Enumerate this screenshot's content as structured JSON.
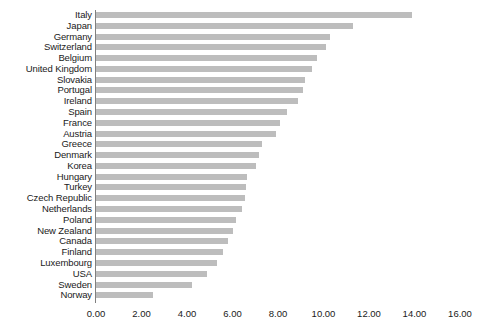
{
  "chart_data": {
    "type": "bar",
    "orientation": "horizontal",
    "title": "",
    "subtitle": "",
    "xlabel": "",
    "ylabel": "",
    "xlim": [
      0,
      16
    ],
    "ylim": null,
    "grid": false,
    "legend": null,
    "legend_position": "none",
    "bar_color": "#bdbdbd",
    "axis_color": "#808080",
    "background_color": "#ffffff",
    "text_color": "#1a1a1a",
    "xticks": [
      "0.00",
      "2.00",
      "4.00",
      "6.00",
      "8.00",
      "10.00",
      "12.00",
      "14.00",
      "16.00"
    ],
    "xtick_values": [
      0,
      2,
      4,
      6,
      8,
      10,
      12,
      14,
      16
    ],
    "categories": [
      "Italy",
      "Japan",
      "Germany",
      "Switzerland",
      "Belgium",
      "United Kingdom",
      "Slovakia",
      "Portugal",
      "Ireland",
      "Spain",
      "France",
      "Austria",
      "Greece",
      "Denmark",
      "Korea",
      "Hungary",
      "Turkey",
      "Czech Republic",
      "Netherlands",
      "Poland",
      "New Zealand",
      "Canada",
      "Finland",
      "Luxembourg",
      "USA",
      "Sweden",
      "Norway"
    ],
    "values": [
      13.9,
      11.3,
      10.3,
      10.1,
      9.7,
      9.5,
      9.2,
      9.1,
      8.9,
      8.4,
      8.1,
      7.9,
      7.3,
      7.15,
      7.05,
      6.65,
      6.6,
      6.55,
      6.4,
      6.15,
      6.0,
      5.8,
      5.6,
      5.3,
      4.9,
      4.2,
      2.5
    ]
  }
}
